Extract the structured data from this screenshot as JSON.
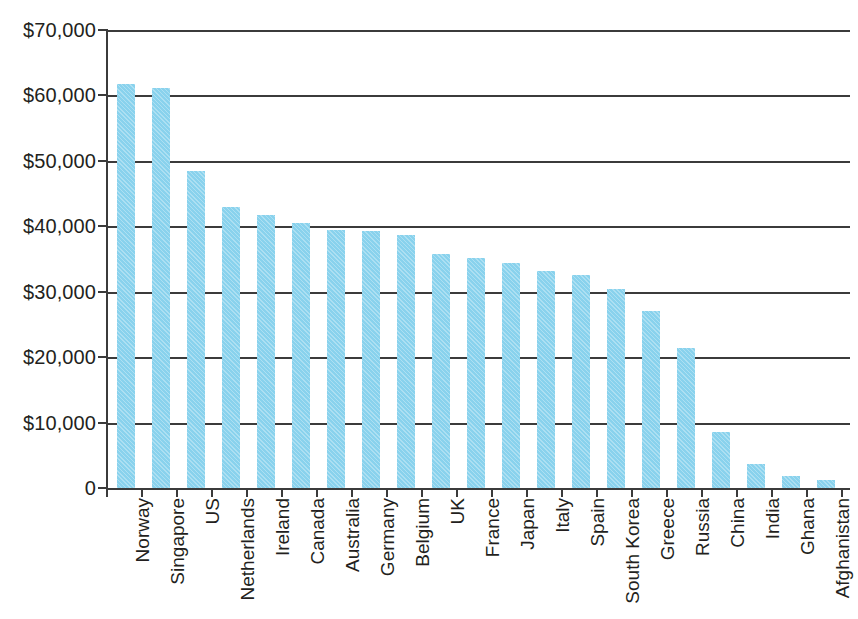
{
  "chart_data": {
    "type": "bar",
    "title": "",
    "subtitle": "",
    "xlabel": "",
    "ylabel": "",
    "ylim": [
      0,
      70000
    ],
    "grid": true,
    "legend": null,
    "y_ticks": [
      0,
      10000,
      20000,
      30000,
      40000,
      50000,
      60000,
      70000
    ],
    "y_tick_labels": [
      "0",
      "$10,000",
      "$20,000",
      "$30,000",
      "$40,000",
      "$50,000",
      "$60,000",
      "$70,000"
    ],
    "categories": [
      "Norway",
      "Singapore",
      "US",
      "Netherlands",
      "Ireland",
      "Canada",
      "Australia",
      "Germany",
      "Belgium",
      "UK",
      "France",
      "Japan",
      "Italy",
      "Spain",
      "South Korea",
      "Greece",
      "Russia",
      "China",
      "India",
      "Ghana",
      "Afghanistan"
    ],
    "values": [
      61800,
      61100,
      48400,
      42900,
      41700,
      40500,
      39500,
      39300,
      38700,
      35700,
      35100,
      34400,
      33100,
      32600,
      30400,
      27100,
      21400,
      8600,
      3700,
      1900,
      1200
    ],
    "bar_color": "#89d2ed",
    "axis_color": "#3b3b3b",
    "text_color": "#231f20"
  }
}
